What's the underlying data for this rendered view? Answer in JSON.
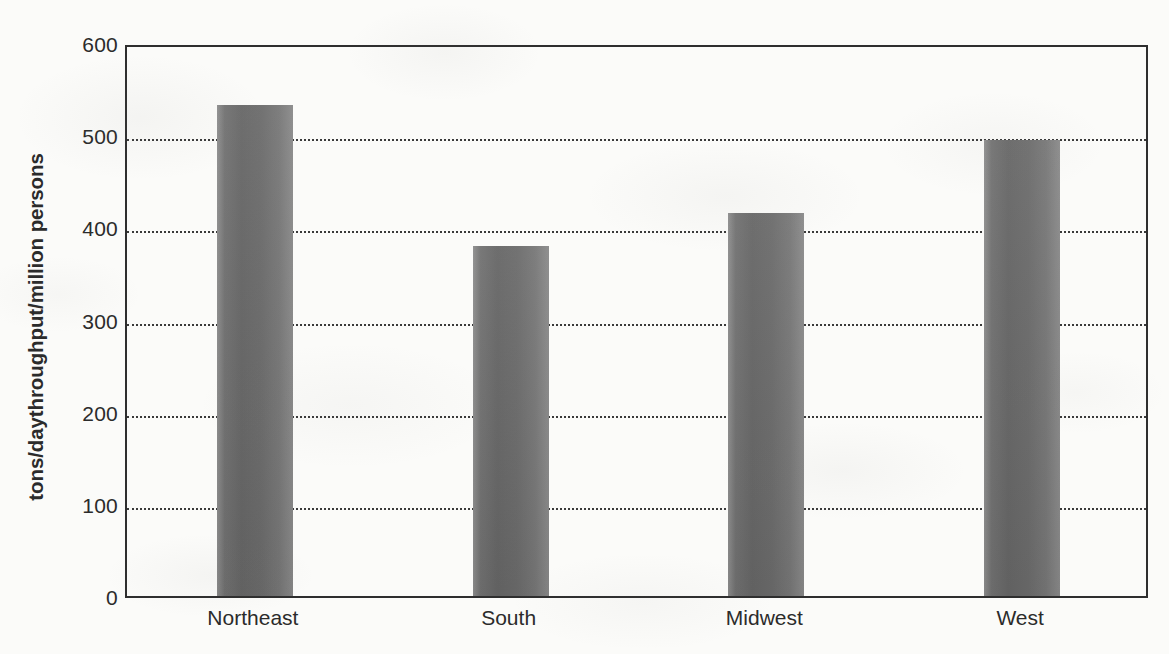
{
  "chart_data": {
    "type": "bar",
    "title": "",
    "subtitle": "",
    "xlabel": "",
    "ylabel": "tons/daythroughput/million persons",
    "categories": [
      "Northeast",
      "South",
      "Midwest",
      "West"
    ],
    "values": [
      533,
      380,
      416,
      495
    ],
    "series": [
      {
        "name": "tons/day throughput per million persons",
        "values": [
          533,
          380,
          416,
          495
        ]
      }
    ],
    "ylim": [
      0,
      600
    ],
    "yticks": [
      0,
      100,
      200,
      300,
      400,
      500,
      600
    ],
    "ytick_labels": [
      "0",
      "100",
      "200",
      "300",
      "400",
      "500",
      "600"
    ],
    "grid": "horizontal-dotted",
    "gridline_values": [
      100,
      200,
      300,
      400,
      500
    ],
    "legend": "none",
    "legend_position": "none",
    "bar_color": "#6e6e6e",
    "axis_color": "#2e2e2e",
    "gridline_color": "#3a3a3a",
    "background_color": "#fbfbf9",
    "text_color": "#2b2b2b",
    "annotations": []
  },
  "figure": {
    "plot_frame": "rectangle",
    "bar_count": 4
  }
}
